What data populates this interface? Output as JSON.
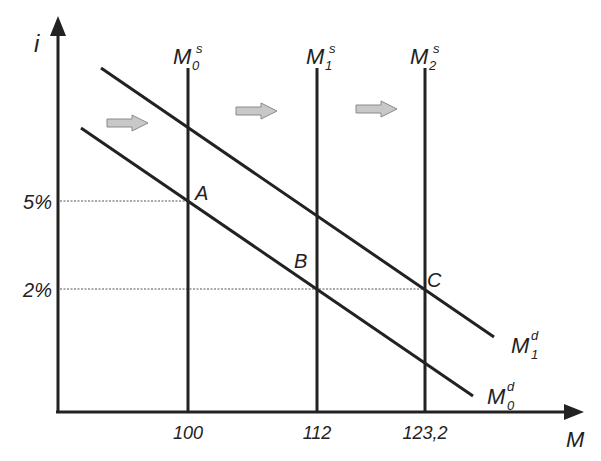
{
  "diagram": {
    "type": "money-market-supply-demand",
    "y_axis_label": "i",
    "x_axis_label": "M",
    "y_ticks": [
      {
        "label": "5%",
        "y": 201
      },
      {
        "label": "2%",
        "y": 289
      }
    ],
    "x_ticks": [
      {
        "label": "100",
        "x": 188
      },
      {
        "label": "112",
        "x": 317
      },
      {
        "label": "123,2",
        "x": 425
      }
    ],
    "supply_curves": [
      {
        "name": "M",
        "sub": "0",
        "sup": "s",
        "x": 188
      },
      {
        "name": "M",
        "sub": "1",
        "sup": "s",
        "x": 317
      },
      {
        "name": "M",
        "sub": "2",
        "sup": "s",
        "x": 425
      }
    ],
    "demand_curves": [
      {
        "name": "M",
        "sub": "0",
        "sup": "d"
      },
      {
        "name": "M",
        "sub": "1",
        "sup": "d"
      }
    ],
    "points": [
      {
        "label": "A",
        "desc": "M0s ∩ M0d at 5%"
      },
      {
        "label": "B",
        "desc": "M1s ∩ M0d at 2%"
      },
      {
        "label": "C",
        "desc": "M2s ∩ M1d at 2%"
      }
    ],
    "shift_arrows": 3,
    "colors": {
      "line": "#222222",
      "arrow_fill": "#c8c8c8",
      "arrow_stroke": "#8a8a8a",
      "dotted": "#555555"
    }
  }
}
